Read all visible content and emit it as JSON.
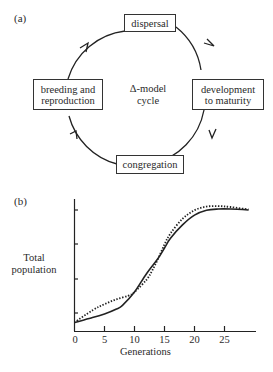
{
  "panel_a": {
    "label": "(a)",
    "center_line1": "Δ-model",
    "center_line2": "cycle",
    "stages": {
      "top": "dispersal",
      "right_line1": "development",
      "right_line2": "to maturity",
      "bottom": "congregation",
      "left_line1": "breeding and",
      "left_line2": "reproduction"
    },
    "flow_direction": "clockwise"
  },
  "panel_b": {
    "label": "(b)",
    "ylabel_line1": "Total",
    "ylabel_line2": "population",
    "xlabel": "Generations",
    "xticks": [
      "0",
      "5",
      "10",
      "15",
      "20",
      "25"
    ]
  },
  "chart_data": {
    "type": "line",
    "title": "",
    "xlabel": "Generations",
    "ylabel": "Total population",
    "xlim": [
      0,
      30
    ],
    "ylim": [
      0,
      4.4
    ],
    "xticks": [
      0,
      5,
      10,
      15,
      20,
      25
    ],
    "yticks_unlabeled": [
      1,
      2,
      3,
      4
    ],
    "grid": false,
    "legend": null,
    "series": [
      {
        "name": "solid",
        "style": "solid",
        "x": [
          0,
          3,
          5,
          7,
          8,
          10,
          12,
          14,
          15,
          16,
          18,
          20,
          22,
          24,
          26,
          28,
          29
        ],
        "values": [
          0.35,
          0.55,
          0.7,
          0.9,
          1.05,
          1.6,
          2.35,
          3.0,
          3.4,
          3.8,
          4.35,
          4.75,
          4.95,
          5.0,
          5.0,
          4.98,
          4.96
        ]
      },
      {
        "name": "dotted",
        "style": "dotted",
        "x": [
          0,
          3,
          5,
          7,
          9,
          10,
          12,
          13,
          14,
          15,
          16,
          18,
          20,
          22,
          24,
          26,
          29
        ],
        "values": [
          0.35,
          0.85,
          1.1,
          1.3,
          1.45,
          1.6,
          2.1,
          2.5,
          3.0,
          3.55,
          4.0,
          4.6,
          4.95,
          5.1,
          5.12,
          5.08,
          4.98
        ]
      }
    ]
  }
}
